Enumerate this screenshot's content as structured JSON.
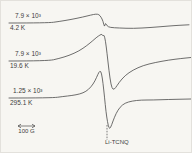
{
  "figure": {
    "background": "#f7f6f2",
    "line_color": "#4a4a4a",
    "curves": [
      {
        "gain": "7.9 × 10³",
        "temperature": "4.2 K"
      },
      {
        "gain": "7.9 × 10³",
        "temperature": "19.6 K"
      },
      {
        "gain": "1.25 × 10³",
        "temperature": "295.1 K"
      }
    ],
    "scale_bar": {
      "label": "100 G"
    },
    "sample_label": "Li-TCNQ",
    "marker": {
      "x": 106,
      "y1": 124,
      "y2": 139
    }
  },
  "chart_data": {
    "type": "line",
    "xlabel": "Magnetic field (unlabeled axis; scale bar = 100 G, ≈17 px)",
    "ylabel": "dP/dH (arbitrary units; receiver gain noted per trace)",
    "legend_position": "left, as gain/temperature fraction labels on each baseline",
    "grid": false,
    "axes_drawn": false,
    "units_note": "points are figure coordinates, y increases downward",
    "series": [
      {
        "name": "4.2 K (gain 7.9 × 10³)",
        "points": [
          [
            8,
            22
          ],
          [
            47,
            22
          ],
          [
            58,
            20.5
          ],
          [
            70,
            18.5
          ],
          [
            82,
            16
          ],
          [
            90,
            14
          ],
          [
            95,
            13
          ],
          [
            98,
            13.5
          ],
          [
            100,
            16
          ],
          [
            102,
            20
          ],
          [
            103.5,
            26.5
          ],
          [
            104.5,
            21.5
          ],
          [
            106,
            25
          ],
          [
            109,
            26.5
          ],
          [
            118,
            27
          ],
          [
            132,
            27.5
          ],
          [
            150,
            26.5
          ],
          [
            168,
            25
          ],
          [
            178,
            24.3
          ],
          [
            188,
            23.8
          ]
        ]
      },
      {
        "name": "19.6 K (gain 7.9 × 10³)",
        "points": [
          [
            8,
            60
          ],
          [
            47,
            60
          ],
          [
            58,
            57.5
          ],
          [
            68,
            54.5
          ],
          [
            78,
            50
          ],
          [
            86,
            44.5
          ],
          [
            92,
            39.5
          ],
          [
            96,
            36
          ],
          [
            99,
            34
          ],
          [
            101,
            33
          ],
          [
            102,
            35.5
          ],
          [
            103,
            33.5
          ],
          [
            104.5,
            40
          ],
          [
            106,
            52
          ],
          [
            108,
            70
          ],
          [
            110,
            84
          ],
          [
            112,
            89
          ],
          [
            114.5,
            87
          ],
          [
            118,
            81.5
          ],
          [
            124,
            74.5
          ],
          [
            132,
            69
          ],
          [
            142,
            64.5
          ],
          [
            154,
            61.5
          ],
          [
            168,
            59
          ],
          [
            180,
            57.5
          ],
          [
            190,
            56.5
          ]
        ]
      },
      {
        "name": "295.1 K (gain 1.25 × 10³)",
        "points": [
          [
            8,
            97
          ],
          [
            51,
            97
          ],
          [
            62,
            95.5
          ],
          [
            71,
            94.5
          ],
          [
            79,
            93
          ],
          [
            85,
            90.5
          ],
          [
            90,
            86
          ],
          [
            94,
            80
          ],
          [
            97,
            73
          ],
          [
            99,
            69.5
          ],
          [
            100.5,
            72
          ],
          [
            102,
            82
          ],
          [
            103.5,
            96
          ],
          [
            105,
            111
          ],
          [
            106.5,
            121
          ],
          [
            108,
            127.5
          ],
          [
            109.5,
            127
          ],
          [
            112,
            120
          ],
          [
            115,
            112.5
          ],
          [
            119,
            106
          ],
          [
            124,
            102
          ],
          [
            131,
            100
          ],
          [
            140,
            99
          ],
          [
            152,
            99
          ],
          [
            166,
            98.5
          ],
          [
            190,
            98
          ]
        ]
      }
    ],
    "annotations": [
      {
        "text": "100 G",
        "kind": "horizontal scale bar with double-headed arrow"
      },
      {
        "text": "Li-TCNQ",
        "kind": "dashed vertical resonance marker at absorption minimum"
      }
    ]
  }
}
